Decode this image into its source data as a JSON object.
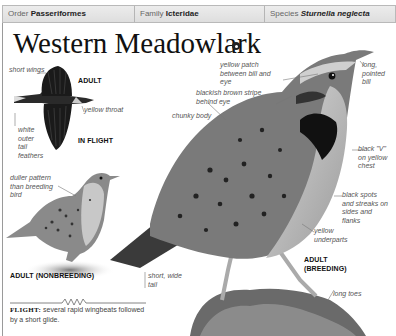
{
  "header": {
    "order_label": "Order",
    "order_value": "Passeriformes",
    "family_label": "Family",
    "family_value": "Icteridae",
    "species_label": "Species",
    "species_value": "Sturnella neglecta"
  },
  "title": "Western Meadowlark",
  "audio_icon": "audio-icon",
  "in_flight": {
    "caption_adult": "ADULT",
    "caption_flight": "IN FLIGHT",
    "labels": {
      "short_wings": "short wings",
      "yellow_throat": "yellow throat",
      "white_tail": "white outer tail feathers"
    }
  },
  "nonbreeding": {
    "caption": "ADULT (NONBREEDING)",
    "labels": {
      "duller": "duller pattern than breeding bird"
    }
  },
  "breeding": {
    "caption_line1": "ADULT",
    "caption_line2": "(BREEDING)",
    "labels": {
      "yellow_patch": "yellow patch between bill and eye",
      "blackish_stripe": "blackish brown stripe behind eye",
      "chunky_body": "chunky body",
      "long_bill": "long, pointed bill",
      "black_v": "black \"V\" on yellow chest",
      "black_spots": "black spots and streaks on sides and flanks",
      "yellow_underparts": "yellow underparts",
      "short_tail": "short, wide tail",
      "long_toes": "long toes"
    }
  },
  "flight": {
    "label": "FLIGHT:",
    "description": "several rapid wingbeats followed by a short glide."
  }
}
